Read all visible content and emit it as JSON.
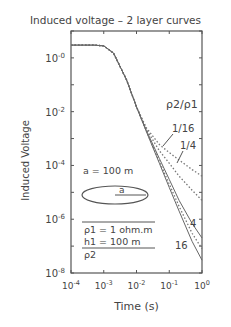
{
  "chart_data": {
    "type": "line",
    "title": "Induced voltage – 2 layer curves",
    "xlabel": "Time (s)",
    "ylabel": "Induced Voltage",
    "xscale": "log",
    "yscale": "log",
    "xlim": [
      0.0001,
      1
    ],
    "ylim": [
      1e-08,
      10
    ],
    "x_ticks": [
      "10-4",
      "10-3",
      "10-2",
      "10-1",
      "100"
    ],
    "y_ticks": [
      "10-0",
      "10-2",
      "10-4",
      "10-6",
      "10-8"
    ],
    "grid": false,
    "legend_title": "ρ2/ρ1",
    "series": [
      {
        "name": "1/16",
        "style": "dotted",
        "x": [
          0.0001,
          0.0005,
          0.001,
          0.002,
          0.005,
          0.01,
          0.02,
          0.05,
          0.1,
          0.2,
          0.5,
          1
        ],
        "y": [
          3,
          3,
          2.8,
          1.5,
          0.15,
          0.015,
          0.0025,
          0.0006,
          0.0003,
          0.00016,
          7e-05,
          4e-05
        ]
      },
      {
        "name": "1/4",
        "style": "dotted",
        "x": [
          0.0001,
          0.0005,
          0.001,
          0.002,
          0.005,
          0.01,
          0.02,
          0.05,
          0.1,
          0.2,
          0.5,
          1
        ],
        "y": [
          3,
          3,
          2.8,
          1.5,
          0.15,
          0.015,
          0.0022,
          0.00035,
          0.00012,
          4e-05,
          1.2e-05,
          5e-06
        ]
      },
      {
        "name": "1",
        "style": "solid",
        "x": [
          0.0001,
          0.0005,
          0.001,
          0.002,
          0.005,
          0.01,
          0.02,
          0.05,
          0.1,
          0.2,
          0.5,
          1
        ],
        "y": [
          3,
          3,
          2.8,
          1.5,
          0.15,
          0.015,
          0.002,
          0.00018,
          3e-05,
          5e-06,
          7e-07,
          2e-07
        ]
      },
      {
        "name": "4",
        "style": "dotted",
        "x": [
          0.0001,
          0.0005,
          0.001,
          0.002,
          0.005,
          0.01,
          0.02,
          0.05,
          0.1,
          0.2,
          0.5,
          1
        ],
        "y": [
          3,
          3,
          2.8,
          1.5,
          0.15,
          0.015,
          0.0019,
          0.00014,
          2e-05,
          3e-06,
          3e-07,
          8e-08
        ]
      },
      {
        "name": "16",
        "style": "solid",
        "x": [
          0.0001,
          0.0005,
          0.001,
          0.002,
          0.005,
          0.01,
          0.02,
          0.05,
          0.1,
          0.2,
          0.5,
          1
        ],
        "y": [
          3,
          3,
          2.8,
          1.5,
          0.15,
          0.015,
          0.0018,
          0.00012,
          1.5e-05,
          2e-06,
          1.5e-07,
          3e-08
        ]
      }
    ],
    "annotations": [
      "ρ2/ρ1",
      "1/16",
      "1/4",
      "4",
      "16",
      "a = 100 m",
      "a",
      "ρ1 = 1 ohm.m",
      "h1 = 100 m",
      "ρ2"
    ]
  },
  "labels": {
    "title": "Induced voltage – 2 layer curves",
    "xlabel": "Time (s)",
    "ylabel": "Induced Voltage",
    "ratio": "ρ2/ρ1",
    "r116": "1/16",
    "r14": "1/4",
    "r4": "4",
    "r16": "16",
    "loop": "a = 100 m",
    "a": "a",
    "rho1": "ρ1 = 1 ohm.m",
    "h1": "h1 = 100 m",
    "rho2": "ρ2"
  }
}
